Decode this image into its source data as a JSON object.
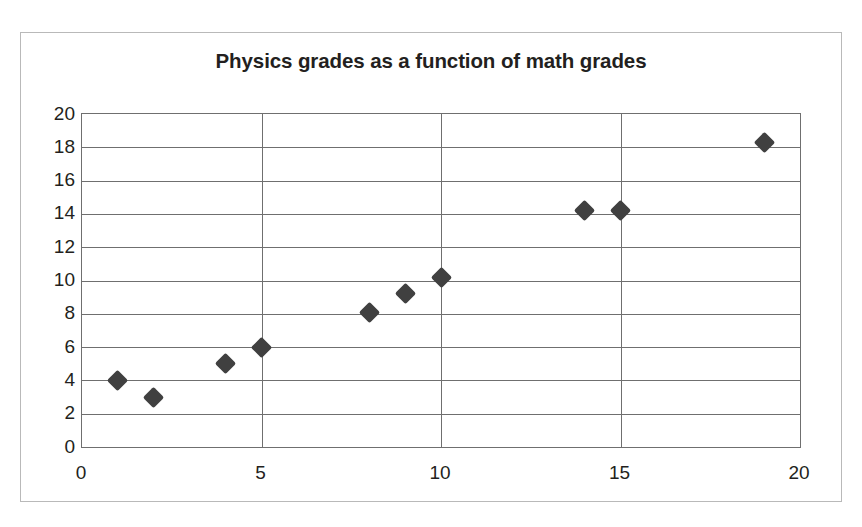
{
  "chart_data": {
    "type": "scatter",
    "title": "Physics grades as a function of math grades",
    "xlabel": "",
    "ylabel": "",
    "xlim": [
      0,
      20
    ],
    "ylim": [
      0,
      20
    ],
    "xticks": [
      0,
      5,
      10,
      15,
      20
    ],
    "yticks": [
      0,
      2,
      4,
      6,
      8,
      10,
      12,
      14,
      16,
      18,
      20
    ],
    "grid": "both",
    "legend": "none",
    "marker_shape": "diamond",
    "marker_color": "#404040",
    "series": [
      {
        "name": "Physics grade vs math grade",
        "points": [
          {
            "x": 1,
            "y": 4.0
          },
          {
            "x": 2,
            "y": 3.0
          },
          {
            "x": 4,
            "y": 5.0
          },
          {
            "x": 5,
            "y": 6.0
          },
          {
            "x": 8,
            "y": 8.1
          },
          {
            "x": 9,
            "y": 9.2
          },
          {
            "x": 10,
            "y": 10.2
          },
          {
            "x": 14,
            "y": 14.2
          },
          {
            "x": 15,
            "y": 14.2
          },
          {
            "x": 19,
            "y": 18.3
          }
        ]
      }
    ]
  },
  "figure": {
    "border_color": "#b9b9b9",
    "plot_border_color": "#6f6f6f",
    "background": "#ffffff"
  }
}
